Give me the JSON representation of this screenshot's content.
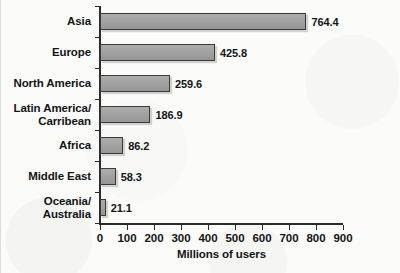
{
  "chart_data": {
    "type": "bar",
    "orientation": "horizontal",
    "title": "",
    "xlabel": "Millions of users",
    "ylabel": "",
    "xlim": [
      0,
      900
    ],
    "xticks": [
      0,
      100,
      200,
      300,
      400,
      500,
      600,
      700,
      800,
      900
    ],
    "xtick_labels": [
      "0",
      "100",
      "200",
      "300",
      "400",
      "500",
      "600",
      "700",
      "800",
      "900"
    ],
    "grid": false,
    "legend": null,
    "categories": [
      "Asia",
      "Europe",
      "North America",
      "Latin America/\nCarribean",
      "Africa",
      "Middle East",
      "Oceania/\nAustralia"
    ],
    "values": [
      764.4,
      425.8,
      259.6,
      186.9,
      86.2,
      58.3,
      21.1
    ],
    "data_labels": [
      "764.4",
      "425.8",
      "259.6",
      "186.9",
      "86.2",
      "58.3",
      "21.1"
    ],
    "bars": [
      {
        "category_line1": "Asia",
        "category_line2": "",
        "value": 764.4,
        "label": "764.4"
      },
      {
        "category_line1": "Europe",
        "category_line2": "",
        "value": 425.8,
        "label": "425.8"
      },
      {
        "category_line1": "North America",
        "category_line2": "",
        "value": 259.6,
        "label": "259.6"
      },
      {
        "category_line1": "Latin America/",
        "category_line2": "Carribean",
        "value": 186.9,
        "label": "186.9"
      },
      {
        "category_line1": "Africa",
        "category_line2": "",
        "value": 86.2,
        "label": "86.2"
      },
      {
        "category_line1": "Middle East",
        "category_line2": "",
        "value": 58.3,
        "label": "58.3"
      },
      {
        "category_line1": "Oceania/",
        "category_line2": "Australia",
        "value": 21.1,
        "label": "21.1"
      }
    ],
    "colors": {
      "bar_fill": "#a2a2a2",
      "bar_edge": "#3a3a3a",
      "axis": "#2b2b2b",
      "text": "#141414",
      "background": "#fbfbfa"
    }
  }
}
